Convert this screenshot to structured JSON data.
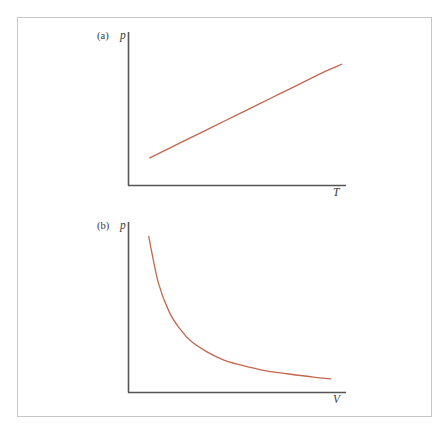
{
  "figure": {
    "background_color": "#ffffff",
    "frame_color": "#c6c6c6",
    "axis_color": "#555555",
    "curve_color": "#c3674e",
    "panels": [
      {
        "tag": "(a)",
        "ylabel": "p",
        "xlabel": "T"
      },
      {
        "tag": "(b)",
        "ylabel": "p",
        "xlabel": "V"
      }
    ]
  },
  "chart_data": [
    {
      "type": "line",
      "panel": "(a)",
      "title": "",
      "xlabel": "T",
      "ylabel": "p",
      "description": "Pressure increases linearly with temperature at constant volume (Gay-Lussac's law)",
      "grid": false,
      "legend": false,
      "xlim": [
        0,
        1
      ],
      "ylim": [
        0,
        1
      ],
      "x": [
        0.1,
        0.2,
        0.3,
        0.4,
        0.5,
        0.6,
        0.7,
        0.8,
        0.9,
        0.98
      ],
      "y": [
        0.18,
        0.25,
        0.32,
        0.39,
        0.46,
        0.53,
        0.6,
        0.67,
        0.74,
        0.79
      ],
      "series": [
        {
          "name": "p vs T",
          "color": "#c3674e",
          "values": [
            0.18,
            0.25,
            0.32,
            0.39,
            0.46,
            0.53,
            0.6,
            0.67,
            0.74,
            0.79
          ]
        }
      ]
    },
    {
      "type": "line",
      "panel": "(b)",
      "title": "",
      "xlabel": "V",
      "ylabel": "p",
      "description": "Pressure varies inversely with volume at constant temperature (Boyle's law)",
      "grid": false,
      "legend": false,
      "xlim": [
        0,
        1
      ],
      "ylim": [
        0,
        1
      ],
      "x": [
        0.095,
        0.14,
        0.19,
        0.24,
        0.29,
        0.36,
        0.44,
        0.52,
        0.62,
        0.73,
        0.85,
        0.93
      ],
      "y": [
        0.915,
        0.64,
        0.47,
        0.37,
        0.3,
        0.24,
        0.19,
        0.16,
        0.13,
        0.11,
        0.09,
        0.08
      ],
      "series": [
        {
          "name": "p vs V",
          "color": "#c3674e",
          "values": [
            0.915,
            0.64,
            0.47,
            0.37,
            0.3,
            0.24,
            0.19,
            0.16,
            0.13,
            0.11,
            0.09,
            0.08
          ]
        }
      ]
    }
  ]
}
